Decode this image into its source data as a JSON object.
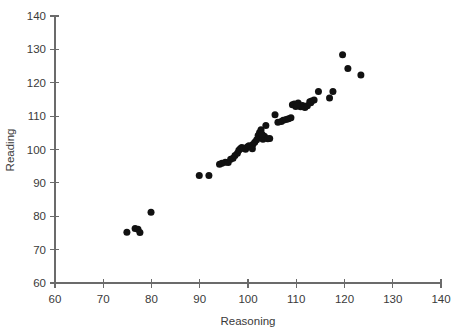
{
  "chart_data": {
    "type": "scatter",
    "title": "",
    "xlabel": "Reasoning",
    "ylabel": "Reading",
    "xlim": [
      60,
      140
    ],
    "ylim": [
      60,
      140
    ],
    "xticks": [
      60,
      70,
      80,
      90,
      100,
      110,
      120,
      130,
      140
    ],
    "yticks": [
      60,
      70,
      80,
      90,
      100,
      110,
      120,
      130,
      140
    ],
    "xtick_labels": [
      "60",
      "70",
      "80",
      "90",
      "100",
      "110",
      "120",
      "130",
      "140"
    ],
    "ytick_labels": [
      "60",
      "70",
      "80",
      "90",
      "100",
      "110",
      "120",
      "130",
      "140"
    ],
    "grid": false,
    "legend": null,
    "marker": "filled-circle",
    "marker_color": "#111111",
    "marker_size": 7,
    "n_points": 62,
    "points": [
      [
        74.9,
        75.2
      ],
      [
        76.6,
        76.3
      ],
      [
        77.2,
        76.1
      ],
      [
        77.6,
        75.1
      ],
      [
        79.9,
        81.2
      ],
      [
        89.9,
        92.2
      ],
      [
        91.9,
        92.2
      ],
      [
        94.1,
        95.6
      ],
      [
        94.6,
        95.9
      ],
      [
        95.3,
        96.2
      ],
      [
        95.9,
        96.1
      ],
      [
        96.4,
        97.1
      ],
      [
        96.9,
        97.4
      ],
      [
        97.3,
        98.2
      ],
      [
        97.8,
        98.9
      ],
      [
        98.1,
        99.8
      ],
      [
        98.4,
        100.2
      ],
      [
        98.7,
        100.6
      ],
      [
        99.1,
        100.4
      ],
      [
        99.5,
        100.1
      ],
      [
        99.9,
        100.8
      ],
      [
        100.2,
        101.1
      ],
      [
        100.6,
        100.9
      ],
      [
        101.0,
        101.5
      ],
      [
        101.4,
        102.2
      ],
      [
        101.8,
        102.9
      ],
      [
        102.1,
        104.2
      ],
      [
        102.4,
        105.1
      ],
      [
        102.7,
        105.9
      ],
      [
        103.1,
        103.1
      ],
      [
        103.4,
        104.0
      ],
      [
        103.7,
        107.2
      ],
      [
        104.1,
        103.2
      ],
      [
        104.5,
        103.3
      ],
      [
        105.6,
        110.4
      ],
      [
        106.9,
        108.4
      ],
      [
        107.3,
        108.8
      ],
      [
        107.9,
        109.0
      ],
      [
        108.4,
        109.2
      ],
      [
        108.9,
        109.5
      ],
      [
        109.2,
        113.4
      ],
      [
        109.6,
        113.6
      ],
      [
        109.9,
        112.9
      ],
      [
        110.4,
        113.9
      ],
      [
        110.9,
        112.8
      ],
      [
        111.3,
        113.2
      ],
      [
        111.8,
        112.6
      ],
      [
        112.3,
        113.1
      ],
      [
        112.8,
        114.3
      ],
      [
        113.2,
        114.5
      ],
      [
        113.7,
        114.8
      ],
      [
        114.6,
        117.4
      ],
      [
        116.9,
        115.4
      ],
      [
        117.6,
        117.4
      ],
      [
        119.6,
        128.4
      ],
      [
        120.7,
        124.3
      ],
      [
        123.4,
        122.3
      ],
      [
        100.9,
        100.2
      ],
      [
        102.9,
        104.6
      ],
      [
        106.2,
        108.2
      ],
      [
        110.1,
        113.2
      ],
      [
        113.0,
        114.0
      ]
    ]
  }
}
